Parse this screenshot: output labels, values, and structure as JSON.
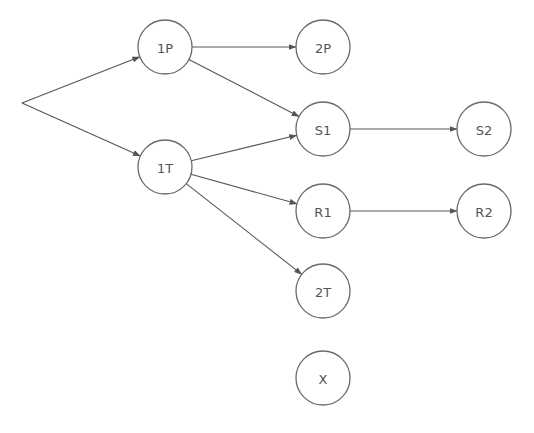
{
  "diagram": {
    "type": "directed-graph",
    "colors": {
      "edge": "#555555",
      "node_stroke": "#6a6a6a",
      "node_fill": "#ffffff",
      "label": "#555555",
      "background": "#ffffff"
    },
    "node_radius": 27,
    "origin": {
      "id": "start",
      "x": 22,
      "y": 103
    },
    "nodes": [
      {
        "id": "1P",
        "label": "1P",
        "x": 165,
        "y": 47
      },
      {
        "id": "1T",
        "label": "1T",
        "x": 165,
        "y": 167
      },
      {
        "id": "2P",
        "label": "2P",
        "x": 323,
        "y": 47
      },
      {
        "id": "S1",
        "label": "S1",
        "x": 323,
        "y": 129
      },
      {
        "id": "R1",
        "label": "R1",
        "x": 323,
        "y": 211
      },
      {
        "id": "2T",
        "label": "2T",
        "x": 323,
        "y": 291
      },
      {
        "id": "X",
        "label": "X",
        "x": 323,
        "y": 378
      },
      {
        "id": "S2",
        "label": "S2",
        "x": 484,
        "y": 129
      },
      {
        "id": "R2",
        "label": "R2",
        "x": 484,
        "y": 211
      }
    ],
    "edges": [
      {
        "from": "start",
        "to": "1P"
      },
      {
        "from": "start",
        "to": "1T"
      },
      {
        "from": "1P",
        "to": "2P"
      },
      {
        "from": "1P",
        "to": "S1"
      },
      {
        "from": "1T",
        "to": "S1"
      },
      {
        "from": "1T",
        "to": "R1"
      },
      {
        "from": "1T",
        "to": "2T"
      },
      {
        "from": "S1",
        "to": "S2"
      },
      {
        "from": "R1",
        "to": "R2"
      }
    ]
  }
}
